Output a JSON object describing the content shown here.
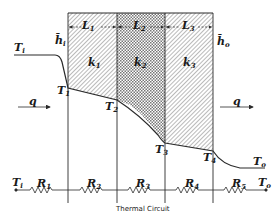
{
  "diagram": {
    "type": "composite wall heat conduction with thermal circuit",
    "layers": [
      {
        "thickness_label": "L",
        "thickness_sub": "1",
        "conductivity_label": "k",
        "conductivity_sub": "1",
        "pattern": "diagonal-hatch"
      },
      {
        "thickness_label": "L",
        "thickness_sub": "2",
        "conductivity_label": "k",
        "conductivity_sub": "2",
        "pattern": "cross-hatch"
      },
      {
        "thickness_label": "L",
        "thickness_sub": "3",
        "conductivity_label": "k",
        "conductivity_sub": "3",
        "pattern": "diagonal-hatch"
      }
    ],
    "inner_fluid": {
      "temp_label": "T",
      "temp_sub": "i",
      "h_label": "h̄",
      "h_sub": "i"
    },
    "outer_fluid": {
      "temp_label": "T",
      "temp_sub": "o",
      "h_label": "h̄",
      "h_sub": "o"
    },
    "heat_flow": {
      "label": "q",
      "arrows": [
        "left",
        "right"
      ]
    },
    "interface_temps": [
      {
        "label": "T",
        "sub": "1"
      },
      {
        "label": "T",
        "sub": "2"
      },
      {
        "label": "T",
        "sub": "3"
      },
      {
        "label": "T",
        "sub": "4"
      }
    ],
    "circuit": {
      "start": {
        "label": "T",
        "sub": "i"
      },
      "end": {
        "label": "T",
        "sub": "o"
      },
      "resistors": [
        {
          "label": "R",
          "sub": "1"
        },
        {
          "label": "R",
          "sub": "2"
        },
        {
          "label": "R",
          "sub": "3"
        },
        {
          "label": "R",
          "sub": "4"
        },
        {
          "label": "R",
          "sub": "5"
        }
      ],
      "caption": "Thermal Circuit"
    }
  },
  "colors": {
    "line": "#2a2a2a",
    "hatch": "#555555",
    "background": "#ffffff"
  }
}
